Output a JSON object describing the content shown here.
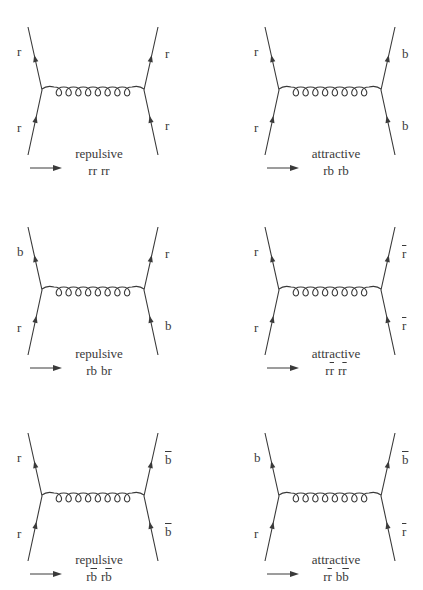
{
  "figure": {
    "line_color": "#3a3a3a",
    "background": "#ffffff",
    "panels": [
      {
        "id": "p1",
        "row": 0,
        "col": 0,
        "labels": {
          "top_left": "r",
          "bottom_left": "r",
          "top_right": "r",
          "bottom_right": "r"
        },
        "bars": {
          "top_left": false,
          "bottom_left": false,
          "top_right": false,
          "bottom_right": false
        },
        "arrow_dir": {
          "left": "up",
          "right": "up"
        },
        "caption": "repulsive",
        "reaction": {
          "lhs": [
            {
              "t": "r",
              "bar": false
            },
            {
              "t": "r",
              "bar": false
            }
          ],
          "rhs": [
            {
              "t": "r",
              "bar": false
            },
            {
              "t": "r",
              "bar": false
            }
          ]
        }
      },
      {
        "id": "p2",
        "row": 0,
        "col": 1,
        "labels": {
          "top_left": "r",
          "bottom_left": "r",
          "top_right": "b",
          "bottom_right": "b"
        },
        "bars": {
          "top_left": false,
          "bottom_left": false,
          "top_right": false,
          "bottom_right": false
        },
        "arrow_dir": {
          "left": "up",
          "right": "up"
        },
        "caption": "attractive",
        "reaction": {
          "lhs": [
            {
              "t": "r",
              "bar": false
            },
            {
              "t": "b",
              "bar": false
            }
          ],
          "rhs": [
            {
              "t": "r",
              "bar": false
            },
            {
              "t": "b",
              "bar": false
            }
          ]
        }
      },
      {
        "id": "p3",
        "row": 1,
        "col": 0,
        "labels": {
          "top_left": "b",
          "bottom_left": "r",
          "top_right": "r",
          "bottom_right": "b"
        },
        "bars": {
          "top_left": false,
          "bottom_left": false,
          "top_right": false,
          "bottom_right": false
        },
        "arrow_dir": {
          "left": "up",
          "right": "up"
        },
        "caption": "repulsive",
        "reaction": {
          "lhs": [
            {
              "t": "r",
              "bar": false
            },
            {
              "t": "b",
              "bar": false
            }
          ],
          "rhs": [
            {
              "t": "b",
              "bar": false
            },
            {
              "t": "r",
              "bar": false
            }
          ]
        }
      },
      {
        "id": "p4",
        "row": 1,
        "col": 1,
        "labels": {
          "top_left": "r",
          "bottom_left": "r",
          "top_right": "r",
          "bottom_right": "r"
        },
        "bars": {
          "top_left": false,
          "bottom_left": false,
          "top_right": true,
          "bottom_right": true
        },
        "arrow_dir": {
          "left": "up",
          "right": "up"
        },
        "caption": "attractive",
        "reaction": {
          "lhs": [
            {
              "t": "r",
              "bar": false
            },
            {
              "t": "r",
              "bar": true
            }
          ],
          "rhs": [
            {
              "t": "r",
              "bar": false
            },
            {
              "t": "r",
              "bar": true
            }
          ]
        }
      },
      {
        "id": "p5",
        "row": 2,
        "col": 0,
        "labels": {
          "top_left": "r",
          "bottom_left": "r",
          "top_right": "b",
          "bottom_right": "b"
        },
        "bars": {
          "top_left": false,
          "bottom_left": false,
          "top_right": true,
          "bottom_right": true
        },
        "arrow_dir": {
          "left": "up",
          "right": "up"
        },
        "caption": "repulsive",
        "reaction": {
          "lhs": [
            {
              "t": "r",
              "bar": false
            },
            {
              "t": "b",
              "bar": true
            }
          ],
          "rhs": [
            {
              "t": "r",
              "bar": false
            },
            {
              "t": "b",
              "bar": true
            }
          ]
        }
      },
      {
        "id": "p6",
        "row": 2,
        "col": 1,
        "labels": {
          "top_left": "b",
          "bottom_left": "r",
          "top_right": "b",
          "bottom_right": "r"
        },
        "bars": {
          "top_left": false,
          "bottom_left": false,
          "top_right": true,
          "bottom_right": true
        },
        "arrow_dir": {
          "left": "up",
          "right": "up"
        },
        "caption": "attractive",
        "reaction": {
          "lhs": [
            {
              "t": "r",
              "bar": false
            },
            {
              "t": "r",
              "bar": true
            }
          ],
          "rhs": [
            {
              "t": "b",
              "bar": false
            },
            {
              "t": "b",
              "bar": true
            }
          ]
        }
      }
    ]
  }
}
